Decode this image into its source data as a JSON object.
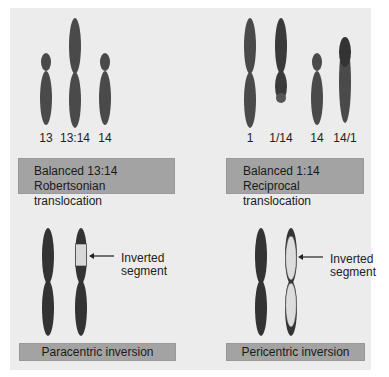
{
  "colors": {
    "background": "#ececec",
    "chromosome": "#4a4a4a",
    "chromosome_dark": "#333333",
    "inverted_segment": "#d8d8d8",
    "caption_box": "#a3a3a3"
  },
  "panels": [
    {
      "id": "robertsonian",
      "chromosome_labels": [
        "13",
        "13:14",
        "14"
      ],
      "caption_line1": "Balanced 13:14",
      "caption_line2": "Robertsonian translocation"
    },
    {
      "id": "reciprocal",
      "chromosome_labels": [
        "1",
        "1/14",
        "14",
        "14/1"
      ],
      "caption_line1": "Balanced 1:14",
      "caption_line2": "Reciprocal translocation"
    },
    {
      "id": "paracentric",
      "annotation_line1": "Inverted",
      "annotation_line2": "segment",
      "caption": "Paracentric inversion"
    },
    {
      "id": "pericentric",
      "annotation_line1": "Inverted",
      "annotation_line2": "segment",
      "caption": "Pericentric inversion"
    }
  ]
}
